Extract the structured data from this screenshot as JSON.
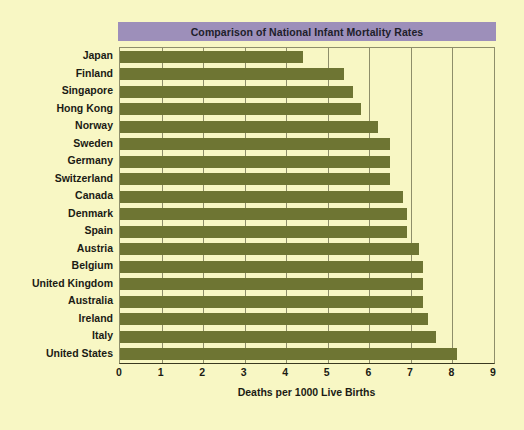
{
  "chart_data": {
    "type": "bar",
    "orientation": "horizontal",
    "title": "Comparison of National Infant Mortality Rates",
    "xlabel": "Deaths per 1000 Live Births",
    "ylabel": "",
    "xlim": [
      0,
      9
    ],
    "xticks": [
      "0",
      "1",
      "2",
      "3",
      "4",
      "5",
      "6",
      "7",
      "8",
      "9"
    ],
    "grid": true,
    "legend": "none",
    "categories": [
      "Japan",
      "Finland",
      "Singapore",
      "Hong Kong",
      "Norway",
      "Sweden",
      "Germany",
      "Switzerland",
      "Canada",
      "Denmark",
      "Spain",
      "Austria",
      "Belgium",
      "United Kingdom",
      "Australia",
      "Ireland",
      "Italy",
      "United States"
    ],
    "values": [
      4.4,
      5.4,
      5.6,
      5.8,
      6.2,
      6.5,
      6.5,
      6.5,
      6.8,
      6.9,
      6.9,
      7.2,
      7.3,
      7.3,
      7.3,
      7.4,
      7.6,
      8.1
    ],
    "colors": {
      "bar": "#6e7533",
      "title_banner": "#9d8fba",
      "background": "#f8f7c4",
      "grid": "#8e8e6a",
      "text": "#1b1b14"
    }
  }
}
